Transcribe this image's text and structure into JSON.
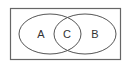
{
  "diagram": {
    "type": "venn",
    "sets": [
      {
        "label": "A"
      },
      {
        "label": "B"
      }
    ],
    "intersection_label": "C",
    "colors": {
      "stroke": "#555555",
      "background": "#ffffff",
      "text": "#333333"
    }
  }
}
